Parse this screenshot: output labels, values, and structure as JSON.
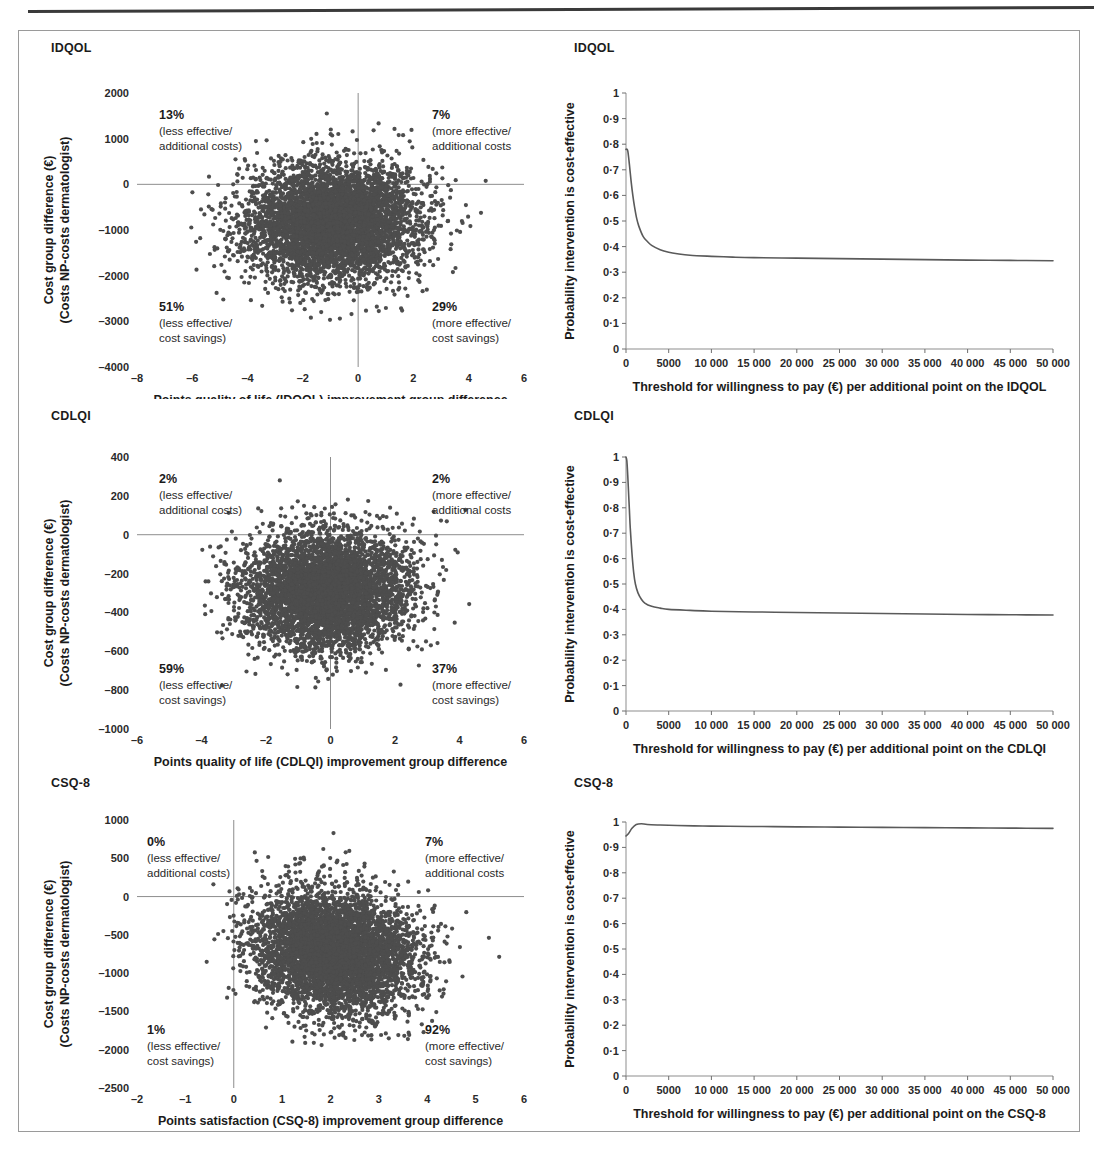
{
  "figure": {
    "panels": [
      {
        "id": "idqol-plane",
        "title": "IDQOL",
        "type": "scatter",
        "xlabel_line1": "Points quality of life (IDQOL) improvement group difference",
        "xlabel_line2": "(NP-dermatologist)",
        "ylabel_line1": "Cost group difference (€)",
        "ylabel_line2": "(Costs NP-costs dermatologist)",
        "xticks": [
          "–8",
          "–6",
          "–4",
          "–2",
          "0",
          "2",
          "4",
          "6"
        ],
        "yticks": [
          "2000",
          "1000",
          "0",
          "–1000",
          "–2000",
          "–3000",
          "–4000"
        ],
        "quadrants": {
          "top_left": {
            "pct": "13%",
            "line1": "(less effective/",
            "line2": "additional costs)"
          },
          "top_right": {
            "pct": "7%",
            "line1": "(more effective/",
            "line2": "additional costs"
          },
          "bottom_left": {
            "pct": "51%",
            "line1": "(less effective/",
            "line2": "cost savings)"
          },
          "bottom_right": {
            "pct": "29%",
            "line1": "(more effective/",
            "line2": "cost savings)"
          }
        }
      },
      {
        "id": "idqol-ceac",
        "title": "IDQOL",
        "type": "line",
        "xlabel": "Threshold for willingness to pay (€) per additional point on the IDQOL",
        "ylabel": "Probability intervention is cost-effective",
        "xticks": [
          "0",
          "5000",
          "10 000",
          "15 000",
          "20 000",
          "25 000",
          "30 000",
          "35 000",
          "40 000",
          "45 000",
          "50 000"
        ],
        "yticks": [
          "0",
          "0·1",
          "0·2",
          "0·3",
          "0·4",
          "0·5",
          "0·6",
          "0·7",
          "0·8",
          "0·9",
          "1"
        ]
      },
      {
        "id": "cdlqi-plane",
        "title": "CDLQI",
        "type": "scatter",
        "xlabel_line1": "Points quality of life (CDLQI) improvement group difference",
        "xlabel_line2": "(NP-dermatologist)",
        "ylabel_line1": "Cost group difference (€)",
        "ylabel_line2": "(Costs NP-costs dermatologist)",
        "xticks": [
          "–6",
          "–4",
          "–2",
          "0",
          "2",
          "4",
          "6"
        ],
        "yticks": [
          "400",
          "200",
          "0",
          "–200",
          "–400",
          "–600",
          "–800",
          "–1000"
        ],
        "quadrants": {
          "top_left": {
            "pct": "2%",
            "line1": "(less effective/",
            "line2": "additional costs)"
          },
          "top_right": {
            "pct": "2%",
            "line1": "(more effective/",
            "line2": "additional costs"
          },
          "bottom_left": {
            "pct": "59%",
            "line1": "(less effective/",
            "line2": "cost savings)"
          },
          "bottom_right": {
            "pct": "37%",
            "line1": "(more effective/",
            "line2": "cost savings)"
          }
        }
      },
      {
        "id": "cdlqi-ceac",
        "title": "CDLQI",
        "type": "line",
        "xlabel": "Threshold for willingness to pay (€) per additional point on the CDLQI",
        "ylabel": "Probability intervention is cost-effective",
        "xticks": [
          "0",
          "5000",
          "10 000",
          "15 000",
          "20 000",
          "25 000",
          "30 000",
          "35 000",
          "40 000",
          "45 000",
          "50 000"
        ],
        "yticks": [
          "0",
          "0·1",
          "0·2",
          "0·3",
          "0·4",
          "0·5",
          "0·6",
          "0·7",
          "0·8",
          "0·9",
          "1"
        ]
      },
      {
        "id": "csq8-plane",
        "title": "CSQ-8",
        "type": "scatter",
        "xlabel_line1": "Points satisfaction (CSQ-8) improvement group difference",
        "xlabel_line2": "(NP-dermatologist)",
        "ylabel_line1": "Cost group difference (€)",
        "ylabel_line2": "(Costs NP-costs dermatologist)",
        "xticks": [
          "–2",
          "–1",
          "0",
          "1",
          "2",
          "3",
          "4",
          "5",
          "6"
        ],
        "yticks": [
          "1000",
          "500",
          "0",
          "–500",
          "–1000",
          "–1500",
          "–2000",
          "–2500"
        ],
        "quadrants": {
          "top_left": {
            "pct": "0%",
            "line1": "(less effective/",
            "line2": "additional costs)"
          },
          "top_right": {
            "pct": "7%",
            "line1": "(more effective/",
            "line2": "additional costs"
          },
          "bottom_left": {
            "pct": "1%",
            "line1": "(less effective/",
            "line2": "cost savings)"
          },
          "bottom_right": {
            "pct": "92%",
            "line1": "(more effective/",
            "line2": "cost savings)"
          }
        }
      },
      {
        "id": "csq8-ceac",
        "title": "CSQ-8",
        "type": "line",
        "xlabel": "Threshold for willingness to pay (€) per additional point on the CSQ-8",
        "ylabel": "Probability intervention is cost-effective",
        "xticks": [
          "0",
          "5000",
          "10 000",
          "15 000",
          "20 000",
          "25 000",
          "30 000",
          "35 000",
          "40 000",
          "45 000",
          "50 000"
        ],
        "yticks": [
          "0",
          "0·1",
          "0·2",
          "0·3",
          "0·4",
          "0·5",
          "0·6",
          "0·7",
          "0·8",
          "0·9",
          "1"
        ]
      }
    ]
  },
  "chart_data": [
    {
      "id": "idqol-plane",
      "type": "scatter",
      "title": "IDQOL",
      "xlabel": "Points quality of life (IDQOL) improvement group difference (NP-dermatologist)",
      "ylabel": "Cost group difference (€) (Costs NP-costs dermatologist)",
      "xlim": [
        -8,
        6
      ],
      "ylim": [
        -4000,
        2000
      ],
      "xtick_values": [
        -8,
        -6,
        -4,
        -2,
        0,
        2,
        4,
        6
      ],
      "ytick_values": [
        2000,
        1000,
        0,
        -1000,
        -2000,
        -3000,
        -4000
      ],
      "grid": false,
      "legend": "none",
      "n_points": 5000,
      "cloud": {
        "x_mean": -0.9,
        "x_sd": 1.55,
        "y_mean": -850,
        "y_sd": 640,
        "corr": 0.05
      },
      "quadrant_percentages": {
        "less_effective_additional_costs": 13,
        "more_effective_additional_costs": 7,
        "less_effective_cost_savings": 51,
        "more_effective_cost_savings": 29
      }
    },
    {
      "id": "idqol-ceac",
      "type": "line",
      "title": "IDQOL",
      "xlabel": "Threshold for willingness to pay (€) per additional point on the IDQOL",
      "ylabel": "Probability intervention is cost-effective",
      "xlim": [
        0,
        50000
      ],
      "ylim": [
        0,
        1
      ],
      "xtick_values": [
        0,
        5000,
        10000,
        15000,
        20000,
        25000,
        30000,
        35000,
        40000,
        45000,
        50000
      ],
      "ytick_values": [
        0,
        0.1,
        0.2,
        0.3,
        0.4,
        0.5,
        0.6,
        0.7,
        0.8,
        0.9,
        1
      ],
      "grid": false,
      "legend": "none",
      "series": [
        {
          "name": "Probability cost-effective (IDQOL)",
          "x": [
            0,
            200,
            400,
            600,
            800,
            1000,
            1250,
            1500,
            2000,
            2500,
            3000,
            4000,
            5000,
            6000,
            7500,
            10000,
            12500,
            15000,
            20000,
            25000,
            30000,
            35000,
            40000,
            45000,
            50000
          ],
          "values": [
            0.78,
            0.775,
            0.72,
            0.655,
            0.6,
            0.555,
            0.51,
            0.48,
            0.44,
            0.42,
            0.405,
            0.388,
            0.378,
            0.372,
            0.366,
            0.362,
            0.359,
            0.357,
            0.355,
            0.353,
            0.351,
            0.349,
            0.347,
            0.346,
            0.345
          ]
        }
      ]
    },
    {
      "id": "cdlqi-plane",
      "type": "scatter",
      "title": "CDLQI",
      "xlabel": "Points quality of life (CDLQI) improvement group difference (NP-dermatologist)",
      "ylabel": "Cost group difference (€) (Costs NP-costs dermatologist)",
      "xlim": [
        -6,
        6
      ],
      "ylim": [
        -1000,
        400
      ],
      "xtick_values": [
        -6,
        -4,
        -2,
        0,
        2,
        4,
        6
      ],
      "ytick_values": [
        400,
        200,
        0,
        -200,
        -400,
        -600,
        -800,
        -1000
      ],
      "grid": false,
      "legend": "none",
      "n_points": 5000,
      "cloud": {
        "x_mean": -0.15,
        "x_sd": 1.25,
        "y_mean": -290,
        "y_sd": 150,
        "corr": 0.05
      },
      "quadrant_percentages": {
        "less_effective_additional_costs": 2,
        "more_effective_additional_costs": 2,
        "less_effective_cost_savings": 59,
        "more_effective_cost_savings": 37
      }
    },
    {
      "id": "cdlqi-ceac",
      "type": "line",
      "title": "CDLQI",
      "xlabel": "Threshold for willingness to pay (€) per additional point on the CDLQI",
      "ylabel": "Probability intervention is cost-effective",
      "xlim": [
        0,
        50000
      ],
      "ylim": [
        0,
        1
      ],
      "xtick_values": [
        0,
        5000,
        10000,
        15000,
        20000,
        25000,
        30000,
        35000,
        40000,
        45000,
        50000
      ],
      "ytick_values": [
        0,
        0.1,
        0.2,
        0.3,
        0.4,
        0.5,
        0.6,
        0.7,
        0.8,
        0.9,
        1
      ],
      "grid": false,
      "legend": "none",
      "series": [
        {
          "name": "Probability cost-effective (CDLQI)",
          "x": [
            0,
            100,
            200,
            300,
            400,
            500,
            700,
            900,
            1100,
            1400,
            1800,
            2200,
            3000,
            4000,
            5000,
            7500,
            10000,
            15000,
            20000,
            25000,
            30000,
            35000,
            40000,
            45000,
            50000
          ],
          "values": [
            1.0,
            0.985,
            0.93,
            0.86,
            0.79,
            0.72,
            0.62,
            0.545,
            0.5,
            0.465,
            0.44,
            0.425,
            0.412,
            0.405,
            0.4,
            0.396,
            0.393,
            0.39,
            0.388,
            0.386,
            0.384,
            0.382,
            0.38,
            0.379,
            0.378
          ]
        }
      ]
    },
    {
      "id": "csq8-plane",
      "type": "scatter",
      "title": "CSQ-8",
      "xlabel": "Points satisfaction (CSQ-8) improvement group difference (NP-dermatologist)",
      "ylabel": "Cost group difference (€) (Costs NP-costs dermatologist)",
      "xlim": [
        -2,
        6
      ],
      "ylim": [
        -2500,
        1000
      ],
      "xtick_values": [
        -2,
        -1,
        0,
        1,
        2,
        3,
        4,
        5,
        6
      ],
      "ytick_values": [
        1000,
        500,
        0,
        -500,
        -1000,
        -1500,
        -2000,
        -2500
      ],
      "grid": false,
      "legend": "none",
      "n_points": 5000,
      "cloud": {
        "x_mean": 2.1,
        "x_sd": 0.82,
        "y_mean": -720,
        "y_sd": 400,
        "corr": -0.12
      },
      "quadrant_percentages": {
        "less_effective_additional_costs": 0,
        "more_effective_additional_costs": 7,
        "less_effective_cost_savings": 1,
        "more_effective_cost_savings": 92
      }
    },
    {
      "id": "csq8-ceac",
      "type": "line",
      "title": "CSQ-8",
      "xlabel": "Threshold for willingness to pay (€) per additional point on the CSQ-8",
      "ylabel": "Probability intervention is cost-effective",
      "xlim": [
        0,
        50000
      ],
      "ylim": [
        0,
        1
      ],
      "xtick_values": [
        0,
        5000,
        10000,
        15000,
        20000,
        25000,
        30000,
        35000,
        40000,
        45000,
        50000
      ],
      "ytick_values": [
        0,
        0.1,
        0.2,
        0.3,
        0.4,
        0.5,
        0.6,
        0.7,
        0.8,
        0.9,
        1
      ],
      "grid": false,
      "legend": "none",
      "series": [
        {
          "name": "Probability cost-effective (CSQ-8)",
          "x": [
            0,
            300,
            700,
            1200,
            1800,
            2500,
            4000,
            6000,
            9000,
            12000,
            16000,
            20000,
            25000,
            30000,
            35000,
            40000,
            45000,
            50000
          ],
          "values": [
            0.945,
            0.955,
            0.975,
            0.99,
            0.993,
            0.99,
            0.988,
            0.986,
            0.984,
            0.983,
            0.982,
            0.981,
            0.98,
            0.979,
            0.978,
            0.977,
            0.976,
            0.975
          ]
        }
      ]
    }
  ]
}
